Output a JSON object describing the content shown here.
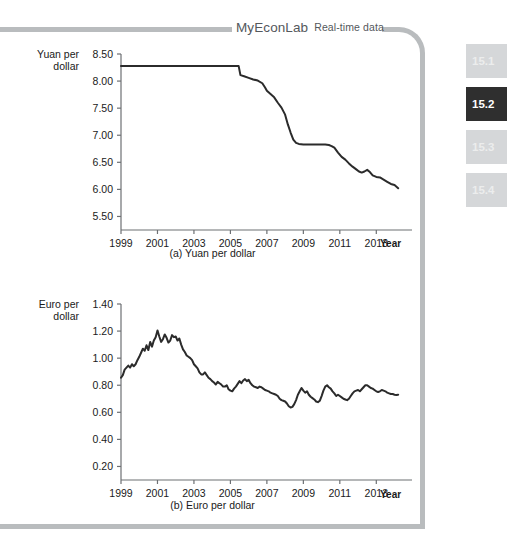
{
  "banner": {
    "brand": "MyEconLab",
    "tagline": "Real-time data"
  },
  "section_tabs": [
    {
      "label": "15.1",
      "active": false
    },
    {
      "label": "15.2",
      "active": true
    },
    {
      "label": "15.3",
      "active": false
    },
    {
      "label": "15.4",
      "active": false
    }
  ],
  "colors": {
    "frame": "#b9bcbe",
    "tab_inactive_bg": "#d5d7d9",
    "tab_inactive_text": "#eceded",
    "tab_active_bg": "#2f2f2f",
    "tab_active_text": "#ffffff",
    "line": "#2b2b2b",
    "axis": "#6d7073",
    "text": "#1a1a1a",
    "banner_text": "#54585c",
    "background": "#ffffff"
  },
  "captions": {
    "a": "(a) Yuan per dollar",
    "b": "(b) Euro per dollar"
  },
  "axis_labels": {
    "x_axis_name_a": "Year",
    "x_axis_name_b": "Year"
  },
  "chart_data": [
    {
      "id": "yuan-per-dollar",
      "type": "line",
      "title": "(a) Yuan per dollar",
      "ylabel": "Yuan per dollar",
      "xlabel": "Year",
      "grid": false,
      "legend": "none",
      "ylim": [
        5.25,
        8.5
      ],
      "yticks": [
        5.5,
        6.0,
        6.5,
        7.0,
        7.5,
        8.0,
        8.5
      ],
      "ytick_labels": [
        "5.50",
        "6.00",
        "6.50",
        "7.00",
        "7.50",
        "8.00",
        "8.50"
      ],
      "xlim": [
        1999,
        2014.3
      ],
      "xticks": [
        1999,
        2001,
        2003,
        2005,
        2007,
        2009,
        2011,
        2013
      ],
      "xtick_labels": [
        "1999",
        "2001",
        "2003",
        "2005",
        "2007",
        "2009",
        "2011",
        "2013"
      ],
      "series": [
        {
          "name": "Yuan per dollar",
          "x": [
            1999.0,
            1999.5,
            2000.0,
            2000.5,
            2001.0,
            2001.5,
            2002.0,
            2002.5,
            2003.0,
            2003.5,
            2004.0,
            2004.5,
            2005.0,
            2005.45,
            2005.55,
            2005.75,
            2006.0,
            2006.25,
            2006.5,
            2006.75,
            2006.9,
            2007.0,
            2007.2,
            2007.4,
            2007.6,
            2007.8,
            2008.0,
            2008.15,
            2008.3,
            2008.45,
            2008.6,
            2008.75,
            2009.0,
            2009.3,
            2009.6,
            2009.9,
            2010.2,
            2010.4,
            2010.55,
            2010.7,
            2010.9,
            2011.1,
            2011.3,
            2011.5,
            2011.7,
            2011.9,
            2012.05,
            2012.2,
            2012.35,
            2012.5,
            2012.65,
            2012.8,
            2013.0,
            2013.2,
            2013.4,
            2013.6,
            2013.8,
            2014.0,
            2014.2
          ],
          "y": [
            8.28,
            8.28,
            8.28,
            8.28,
            8.28,
            8.28,
            8.28,
            8.28,
            8.28,
            8.28,
            8.28,
            8.28,
            8.28,
            8.28,
            8.11,
            8.09,
            8.06,
            8.03,
            8.01,
            7.96,
            7.88,
            7.82,
            7.76,
            7.7,
            7.6,
            7.51,
            7.38,
            7.2,
            7.05,
            6.92,
            6.86,
            6.84,
            6.83,
            6.83,
            6.83,
            6.83,
            6.83,
            6.82,
            6.8,
            6.77,
            6.68,
            6.6,
            6.55,
            6.48,
            6.42,
            6.37,
            6.33,
            6.31,
            6.33,
            6.36,
            6.32,
            6.26,
            6.23,
            6.22,
            6.18,
            6.14,
            6.1,
            6.08,
            6.02
          ]
        }
      ]
    },
    {
      "id": "euro-per-dollar",
      "type": "line",
      "title": "(b) Euro per dollar",
      "ylabel": "Euro per dollar",
      "xlabel": "Year",
      "grid": false,
      "legend": "none",
      "ylim": [
        0.1,
        1.4
      ],
      "yticks": [
        0.2,
        0.4,
        0.6,
        0.8,
        1.0,
        1.2,
        1.4
      ],
      "ytick_labels": [
        "0.20",
        "0.40",
        "0.60",
        "0.80",
        "1.00",
        "1.20",
        "1.40"
      ],
      "xlim": [
        1999,
        2014.3
      ],
      "xticks": [
        1999,
        2001,
        2003,
        2005,
        2007,
        2009,
        2011,
        2013
      ],
      "xtick_labels": [
        "1999",
        "2001",
        "2003",
        "2005",
        "2007",
        "2009",
        "2011",
        "2013"
      ],
      "series": [
        {
          "name": "Euro per dollar",
          "x": [
            1999.0,
            1999.1,
            1999.2,
            1999.3,
            1999.4,
            1999.5,
            1999.6,
            1999.7,
            1999.8,
            1999.9,
            2000.0,
            2000.1,
            2000.2,
            2000.3,
            2000.4,
            2000.5,
            2000.6,
            2000.7,
            2000.8,
            2000.9,
            2001.0,
            2001.1,
            2001.2,
            2001.3,
            2001.4,
            2001.5,
            2001.6,
            2001.7,
            2001.8,
            2001.9,
            2002.0,
            2002.1,
            2002.2,
            2002.3,
            2002.4,
            2002.5,
            2002.6,
            2002.7,
            2002.8,
            2002.9,
            2003.0,
            2003.1,
            2003.2,
            2003.3,
            2003.4,
            2003.5,
            2003.6,
            2003.7,
            2003.8,
            2003.9,
            2004.0,
            2004.1,
            2004.2,
            2004.3,
            2004.4,
            2004.5,
            2004.6,
            2004.7,
            2004.8,
            2004.9,
            2005.0,
            2005.1,
            2005.2,
            2005.3,
            2005.4,
            2005.5,
            2005.6,
            2005.7,
            2005.8,
            2005.9,
            2006.0,
            2006.1,
            2006.2,
            2006.3,
            2006.4,
            2006.5,
            2006.6,
            2006.7,
            2006.8,
            2006.9,
            2007.0,
            2007.1,
            2007.2,
            2007.3,
            2007.4,
            2007.5,
            2007.6,
            2007.7,
            2007.8,
            2007.9,
            2008.0,
            2008.1,
            2008.2,
            2008.3,
            2008.4,
            2008.5,
            2008.6,
            2008.7,
            2008.8,
            2008.9,
            2009.0,
            2009.1,
            2009.2,
            2009.3,
            2009.4,
            2009.5,
            2009.6,
            2009.7,
            2009.8,
            2009.9,
            2010.0,
            2010.1,
            2010.2,
            2010.3,
            2010.4,
            2010.5,
            2010.6,
            2010.7,
            2010.8,
            2010.9,
            2011.0,
            2011.1,
            2011.2,
            2011.3,
            2011.4,
            2011.5,
            2011.6,
            2011.7,
            2011.8,
            2011.9,
            2012.0,
            2012.1,
            2012.2,
            2012.3,
            2012.4,
            2012.5,
            2012.6,
            2012.7,
            2012.8,
            2012.9,
            2013.0,
            2013.1,
            2013.2,
            2013.3,
            2013.4,
            2013.5,
            2013.6,
            2013.7,
            2013.8,
            2013.9,
            2014.0,
            2014.1,
            2014.2
          ],
          "y": [
            0.855,
            0.875,
            0.915,
            0.93,
            0.945,
            0.93,
            0.955,
            0.94,
            0.955,
            0.985,
            1.01,
            1.04,
            1.07,
            1.055,
            1.095,
            1.06,
            1.12,
            1.085,
            1.13,
            1.155,
            1.205,
            1.16,
            1.12,
            1.14,
            1.175,
            1.15,
            1.115,
            1.13,
            1.17,
            1.155,
            1.16,
            1.13,
            1.145,
            1.1,
            1.065,
            1.045,
            1.02,
            1.01,
            1.0,
            0.985,
            0.955,
            0.94,
            0.925,
            0.895,
            0.88,
            0.88,
            0.895,
            0.875,
            0.855,
            0.845,
            0.83,
            0.82,
            0.805,
            0.825,
            0.815,
            0.805,
            0.79,
            0.79,
            0.8,
            0.77,
            0.76,
            0.755,
            0.775,
            0.79,
            0.81,
            0.83,
            0.815,
            0.835,
            0.845,
            0.83,
            0.84,
            0.815,
            0.8,
            0.79,
            0.785,
            0.78,
            0.79,
            0.785,
            0.775,
            0.765,
            0.76,
            0.755,
            0.745,
            0.74,
            0.735,
            0.73,
            0.72,
            0.7,
            0.69,
            0.685,
            0.68,
            0.665,
            0.645,
            0.635,
            0.64,
            0.66,
            0.69,
            0.73,
            0.755,
            0.78,
            0.76,
            0.745,
            0.755,
            0.73,
            0.715,
            0.705,
            0.695,
            0.68,
            0.675,
            0.685,
            0.72,
            0.76,
            0.79,
            0.8,
            0.785,
            0.775,
            0.755,
            0.74,
            0.72,
            0.73,
            0.72,
            0.71,
            0.7,
            0.695,
            0.69,
            0.7,
            0.72,
            0.74,
            0.755,
            0.76,
            0.765,
            0.755,
            0.77,
            0.785,
            0.8,
            0.8,
            0.79,
            0.78,
            0.775,
            0.765,
            0.755,
            0.75,
            0.755,
            0.765,
            0.76,
            0.755,
            0.745,
            0.74,
            0.735,
            0.735,
            0.73,
            0.728,
            0.73
          ]
        }
      ]
    }
  ]
}
